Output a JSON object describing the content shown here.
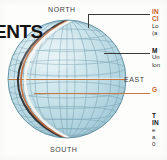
{
  "page": {
    "title_clipped": "ENTS",
    "background_color": "#fdfdfc"
  },
  "globe": {
    "name": "globe-graticule-diagram",
    "ocean_color": "#b9d9e2",
    "ocean_color_light": "#d9ecf1",
    "grid_color": "#7fa8b8",
    "outline_color": "#5c8d9e",
    "meridian_band_dark": "#2f2f33",
    "meridian_band_orange": "#c06a3c",
    "meridian_band_white": "#f2f2ee",
    "equator_color": "#c87941",
    "direction_labels": {
      "north": "NORTH",
      "south": "SOUTH",
      "east": "EAST"
    }
  },
  "annotations": [
    {
      "id": "note-a",
      "heading_line1": "IN",
      "heading_line2": "CI",
      "body_line1": "Lo",
      "body_line2": "(a",
      "heading_color": "#c8601e"
    },
    {
      "id": "note-b",
      "heading_line1": "M",
      "body_line1": "Un",
      "body_line2": "lon",
      "heading_color": "#141414"
    },
    {
      "id": "note-c",
      "heading_line1": "G",
      "heading_color": "#c8601e"
    },
    {
      "id": "note-d",
      "heading_line1": "T",
      "heading_line2": "IN",
      "body_line1": "e",
      "body_line2": "a",
      "body_line3": "0",
      "heading_color": "#141414"
    }
  ],
  "leaders": {
    "leader_color": "#3a3a3a",
    "equator_leader_color": "#c87941"
  }
}
